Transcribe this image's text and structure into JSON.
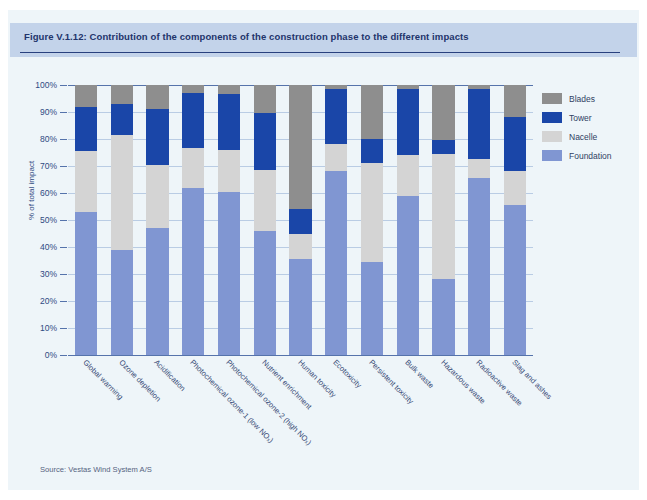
{
  "figure": {
    "title": "Figure V.1.12: Contribution of the components of the construction phase to the different impacts",
    "source": "Source: Vestas Wind System A/S"
  },
  "legend": {
    "position": "right",
    "items": [
      {
        "label": "Blades",
        "color": "#8e8e8e"
      },
      {
        "label": "Tower",
        "color": "#1a46a8"
      },
      {
        "label": "Nacelle",
        "color": "#d4d4d4"
      },
      {
        "label": "Foundation",
        "color": "#8096d2"
      }
    ]
  },
  "chart_data": {
    "type": "bar",
    "stacked": true,
    "stack_total": 100,
    "title": "Contribution of the components of the construction phase to the different impacts",
    "xlabel": "",
    "ylabel": "% of total impact",
    "ylim": [
      0,
      100
    ],
    "ytick_step": 10,
    "grid": true,
    "legend_position": "right",
    "ytick_labels": [
      "0%",
      "10%",
      "20%",
      "30%",
      "40%",
      "50%",
      "60%",
      "70%",
      "80%",
      "90%",
      "100%"
    ],
    "categories": [
      "Global warming",
      "Ozone depletion",
      "Acidification",
      "Photochemical ozone-1 (low NOₓ)",
      "Photochemical ozone-2 (high NOₓ)",
      "Nutrient enrichment",
      "Human toxicity",
      "Ecotoxicity",
      "Persistent toxicity",
      "Bulk waste",
      "Hazardous waste",
      "Radioactive waste",
      "Slag and ashes"
    ],
    "series": [
      {
        "name": "Foundation",
        "color": "#8096d2",
        "values": [
          53,
          39,
          47,
          62,
          60.5,
          46,
          35.5,
          68,
          34.5,
          59,
          28,
          65.5,
          55.5
        ]
      },
      {
        "name": "Nacelle",
        "color": "#d4d4d4",
        "values": [
          22.5,
          42.5,
          23.5,
          14.5,
          15.5,
          22.5,
          9.5,
          10,
          36.5,
          15,
          46.5,
          7,
          12.5
        ]
      },
      {
        "name": "Tower",
        "color": "#1a46a8",
        "values": [
          16.5,
          11.5,
          20.5,
          20.5,
          20.5,
          21,
          9,
          20.5,
          9,
          24.5,
          5,
          26,
          20
        ]
      },
      {
        "name": "Blades",
        "color": "#8e8e8e",
        "values": [
          8,
          7,
          9,
          3,
          3.5,
          10.5,
          46,
          1.5,
          20,
          1.5,
          20.5,
          1.5,
          12
        ]
      }
    ]
  }
}
